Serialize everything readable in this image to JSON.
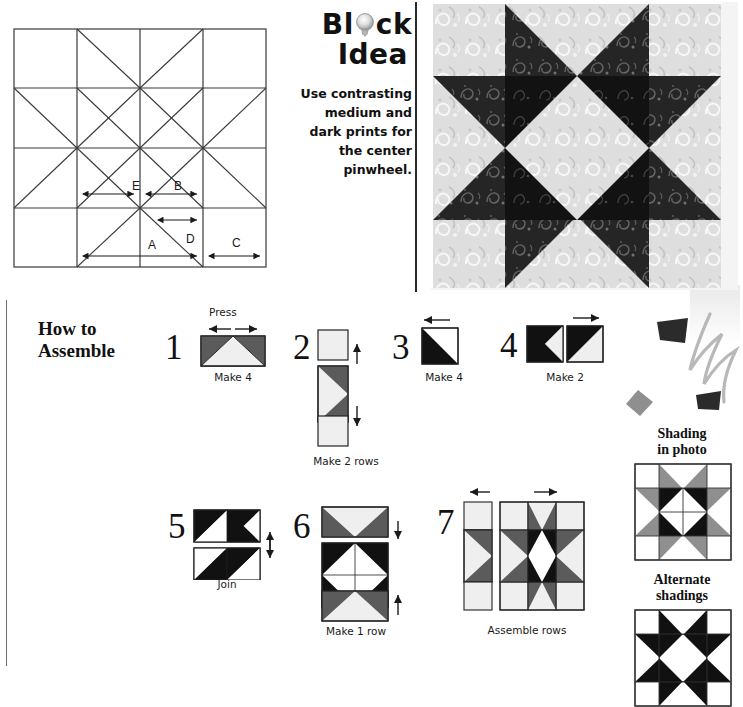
{
  "block_idea": {
    "title_line1": "Bl",
    "title_line1_tail": "ck",
    "title_line2": "Idea",
    "body": "Use contrasting medium and dark prints for the center pinwheel.",
    "icon": "lightbulb-icon"
  },
  "draft": {
    "piece_labels": [
      "E",
      "B",
      "A",
      "D",
      "C"
    ],
    "label_E": "E",
    "label_B": "B",
    "label_A": "A",
    "label_D": "D",
    "label_C": "C"
  },
  "photo": {
    "alt": "pieced eight-pointed star quilt block in medium and dark paisley prints"
  },
  "assemble": {
    "heading_line1": "How to",
    "heading_line2": "Assemble",
    "steps": [
      {
        "number": "1",
        "caption": "Make 4",
        "press": "Press"
      },
      {
        "number": "2",
        "caption": "Make 2 rows",
        "press": ""
      },
      {
        "number": "3",
        "caption": "Make 4",
        "press": ""
      },
      {
        "number": "4",
        "caption": "Make 2",
        "press": ""
      },
      {
        "number": "5",
        "caption": "Join",
        "press": ""
      },
      {
        "number": "6",
        "caption": "Make 1 row",
        "press": ""
      },
      {
        "number": "7",
        "caption": "Assemble rows",
        "press": ""
      }
    ]
  },
  "shadings": {
    "photo_title_line1": "Shading",
    "photo_title_line2": "in photo",
    "alt_title_line1": "Alternate",
    "alt_title_line2": "shadings"
  },
  "colors": {
    "dark": "#111111",
    "medium": "#808080",
    "light": "#f2f2f2",
    "line": "#2a2a2a",
    "step_dark_gray": "#5b5b5b",
    "step_light": "#efefef"
  }
}
